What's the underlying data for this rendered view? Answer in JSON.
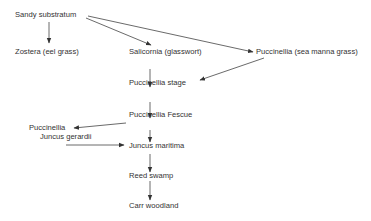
{
  "nodes": {
    "sandy": "Sandy substratum",
    "zostera": "Zostera (eel grass)",
    "salicornia": "Salicornia (glasswort)",
    "puccinellia_sea": "Puccinellia (sea manna grass)",
    "puccinellia_stage": "Puccinellia stage",
    "puccinellia_fescue": "Puccinellia Fescue",
    "puccinellia_left": "Puccinellia",
    "juncus_gerardii": "Juncus gerardii",
    "juncus_maritima": "Juncus maritima",
    "reed_swamp": "Reed swamp",
    "carr_woodland": "Carr woodland"
  },
  "edges": [
    {
      "from": "Sandy substratum",
      "to": "Zostera (eel grass)"
    },
    {
      "from": "Sandy substratum",
      "to": "Salicornia (glasswort)"
    },
    {
      "from": "Sandy substratum",
      "to": "Puccinellia (sea manna grass)"
    },
    {
      "from": "Salicornia (glasswort)",
      "to": "Puccinellia stage"
    },
    {
      "from": "Puccinellia (sea manna grass)",
      "to": "Puccinellia stage"
    },
    {
      "from": "Puccinellia stage",
      "to": "Puccinellia Fescue"
    },
    {
      "from": "Puccinellia Fescue",
      "to": "Puccinellia"
    },
    {
      "from": "Puccinellia Fescue",
      "to": "Juncus maritima"
    },
    {
      "from": "Juncus gerardii",
      "to": "Juncus maritima"
    },
    {
      "from": "Juncus maritima",
      "to": "Reed swamp"
    },
    {
      "from": "Reed swamp",
      "to": "Carr woodland"
    }
  ]
}
